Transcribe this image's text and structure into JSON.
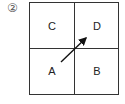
{
  "figure": {
    "number_label": "②",
    "cells": {
      "top_left": "C",
      "top_right": "D",
      "bottom_left": "A",
      "bottom_right": "B"
    },
    "arrow": {
      "from": "A",
      "to": "D",
      "color": "#111111"
    },
    "line_color": "#333333"
  }
}
